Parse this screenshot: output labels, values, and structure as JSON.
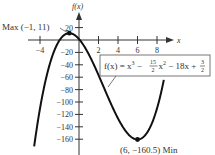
{
  "chart_data": {
    "type": "line",
    "title": "",
    "function": "f(x) = x^3 - (15/2)x^2 - 18x + 3/2",
    "xlabel": "x",
    "ylabel": "f(x)",
    "xlim": [
      -4.5,
      9
    ],
    "ylim": [
      -180,
      25
    ],
    "x_ticks": [
      -4,
      2,
      4,
      6,
      8
    ],
    "x_tick_labels": [
      "-4",
      "2",
      "4",
      "6",
      "8"
    ],
    "y_ticks": [
      20,
      -20,
      -40,
      -60,
      -80,
      -100,
      -120,
      -140,
      -160
    ],
    "y_tick_labels": [
      "20",
      "−20",
      "−40",
      "−60",
      "−80",
      "−100",
      "−120",
      "−140",
      "−160"
    ],
    "grid": false,
    "series": [
      {
        "name": "f(x)",
        "x": [
          -4.5,
          -4,
          -3,
          -2,
          -1,
          0,
          1,
          2,
          3,
          4,
          5,
          6,
          7,
          8,
          8.5
        ],
        "y": [
          -159.2,
          -110.5,
          -39,
          1.5,
          11,
          1.5,
          -23,
          -60.5,
          -105,
          -150.5,
          -136,
          -160.5,
          -140.5,
          -118.5,
          -91.9
        ]
      }
    ],
    "annotations": [
      {
        "text": "Max (−1, 11)",
        "x": -1,
        "y": 11,
        "kind": "local maximum"
      },
      {
        "text": "(6, −160.5) Min",
        "x": 6,
        "y": -160.5,
        "kind": "local minimum"
      }
    ]
  },
  "labels": {
    "y_axis": "f(x)",
    "x_axis": "x",
    "max_label": "Max (−1, 11)",
    "min_label": "(6, −160.5) Min",
    "equation_prefix": "f(x) = x",
    "equation_exp3": "3",
    "equation_mid": " − ",
    "frac_num": "15",
    "frac_den": "2",
    "equation_x2": "x",
    "equation_exp2": "2",
    "equation_tail": " − 18x + ",
    "frac2_num": "3",
    "frac2_den": "2"
  },
  "ticks": {
    "x": [
      {
        "label": "−4",
        "px": 40
      },
      {
        "label": "2",
        "px": 98.5
      },
      {
        "label": "4",
        "px": 118
      },
      {
        "label": "6",
        "px": 137.5
      },
      {
        "label": "8",
        "px": 157
      }
    ],
    "y": [
      {
        "label": "20",
        "py": 27.6
      },
      {
        "label": "−20",
        "py": 52.4
      },
      {
        "label": "−40",
        "py": 64.8
      },
      {
        "label": "−60",
        "py": 77.2
      },
      {
        "label": "−80",
        "py": 89.6
      },
      {
        "label": "−100",
        "py": 102
      },
      {
        "label": "−120",
        "py": 114.4
      },
      {
        "label": "−140",
        "py": 126.8
      },
      {
        "label": "−160",
        "py": 139.2
      }
    ]
  },
  "colors": {
    "curve": "#111111",
    "axis": "#333333",
    "text": "#333333",
    "box_border": "#555555"
  }
}
